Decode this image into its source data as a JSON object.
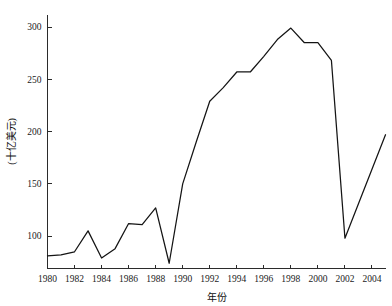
{
  "chart_data": {
    "type": "line",
    "title": "",
    "xlabel": "年份",
    "ylabel": "(十亿美元)",
    "x": [
      1980,
      1981,
      1982,
      1983,
      1984,
      1985,
      1986,
      1987,
      1988,
      1989,
      1990,
      1991,
      1992,
      1993,
      1994,
      1995,
      1996,
      1997,
      1998,
      1999,
      2000,
      2001,
      2002,
      2003,
      2004,
      2005
    ],
    "values": [
      81,
      82,
      85,
      105,
      79,
      88,
      112,
      111,
      127,
      74,
      150,
      190,
      229,
      242,
      257,
      257,
      272,
      288,
      299,
      285,
      285,
      268,
      98,
      131,
      164,
      197
    ],
    "series": [
      {
        "name": "金额",
        "values": [
          81,
          82,
          85,
          105,
          79,
          88,
          112,
          111,
          127,
          74,
          150,
          190,
          229,
          242,
          257,
          257,
          272,
          288,
          299,
          285,
          285,
          268,
          98,
          131,
          164,
          197
        ]
      }
    ],
    "xlim": [
      1980,
      2005
    ],
    "ylim": [
      69,
      312
    ],
    "xticks": [
      1980,
      1982,
      1984,
      1986,
      1988,
      1990,
      1992,
      1994,
      1996,
      1998,
      2000,
      2002,
      2004
    ],
    "xtick_labels": [
      "1980",
      "1982",
      "1984",
      "1986",
      "1988",
      "1990",
      "1992",
      "1994",
      "1996",
      "1998",
      "2000",
      "2002",
      "2004"
    ],
    "yticks": [
      100,
      150,
      200,
      250,
      300
    ],
    "ytick_labels": [
      "100",
      "150",
      "200",
      "250",
      "300"
    ],
    "grid": false,
    "legend": null,
    "legend_position": "none",
    "line_color": "#141414",
    "axis_color": "#2b2b2b",
    "background_color": "#ffffff"
  }
}
